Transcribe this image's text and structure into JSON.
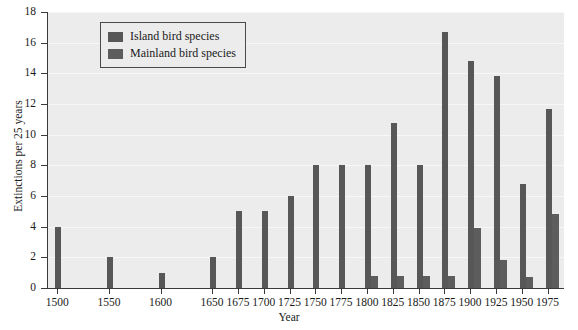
{
  "chart_data": {
    "type": "bar",
    "title": "",
    "xlabel": "Year",
    "ylabel": "Extinctions per 25 years",
    "categories": [
      "1500",
      "1525",
      "1550",
      "1575",
      "1600",
      "1625",
      "1650",
      "1675",
      "1700",
      "1725",
      "1750",
      "1775",
      "1800",
      "1825",
      "1850",
      "1875",
      "1900",
      "1925",
      "1950",
      "1975"
    ],
    "xtick_labels": [
      "1500",
      "1550",
      "1600",
      "1650",
      "1675",
      "1700",
      "1725",
      "1750",
      "1775",
      "1800",
      "1825",
      "1850",
      "1875",
      "1900",
      "1925",
      "1950",
      "1975"
    ],
    "xlim": [
      1490,
      1990
    ],
    "ylim": [
      0,
      18
    ],
    "yticks": [
      0,
      2,
      4,
      6,
      8,
      10,
      12,
      14,
      16,
      18
    ],
    "grid": true,
    "legend_position": "upper-left-inside",
    "series": [
      {
        "name": "Island bird species",
        "color": "#575757",
        "values": [
          4,
          0,
          2,
          0,
          1,
          0,
          2,
          5,
          5,
          6,
          8,
          8,
          8,
          10.75,
          8,
          16.7,
          14.8,
          13.8,
          6.8,
          11.7
        ]
      },
      {
        "name": "Mainland bird species",
        "color": "#5d5d5d",
        "values": [
          0,
          0,
          0,
          0,
          0,
          0,
          0,
          0,
          0,
          0,
          0,
          0,
          0.8,
          0.8,
          0.8,
          0.8,
          3.9,
          1.8,
          0.7,
          4.8
        ]
      }
    ]
  },
  "legend": {
    "items": [
      {
        "label": "Island bird species",
        "color": "#575757"
      },
      {
        "label": "Mainland bird species",
        "color": "#5d5d5d"
      }
    ]
  },
  "axes": {
    "y_title": "Extinctions per 25 years",
    "x_title": "Year"
  }
}
